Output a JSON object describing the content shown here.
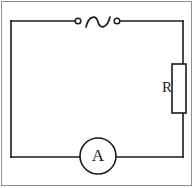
{
  "figure": {
    "type": "circuit-diagram",
    "width": 194,
    "height": 188,
    "background_color": "#ffffff",
    "frame_color": "#8e8e8e",
    "wire_color": "#1b1b1b",
    "wire_width": 1.6
  },
  "components": {
    "source": {
      "name": "AC source",
      "symbol": "sine-wave",
      "terminal_left": {
        "label": "",
        "shape": "open-circle",
        "cx": 78,
        "cy": 21,
        "r": 3
      },
      "terminal_right": {
        "label": "",
        "shape": "open-circle",
        "cx": 117,
        "cy": 21,
        "r": 3
      },
      "wave": {
        "x_start": 86,
        "x_end": 110,
        "y_center": 22,
        "amplitude": 6
      }
    },
    "resistor": {
      "name": "Resistor",
      "label": "R",
      "shape": "rectangle",
      "x": 172,
      "y": 64,
      "width": 14,
      "height": 49,
      "label_x": 162,
      "label_y": 80
    },
    "meter": {
      "name": "Ammeter",
      "label": "A",
      "shape": "circle",
      "cx": 98,
      "cy": 156,
      "r": 18
    }
  },
  "loop": {
    "left_x": 11,
    "right_x": 183,
    "top_y": 21,
    "bottom_y": 157
  }
}
